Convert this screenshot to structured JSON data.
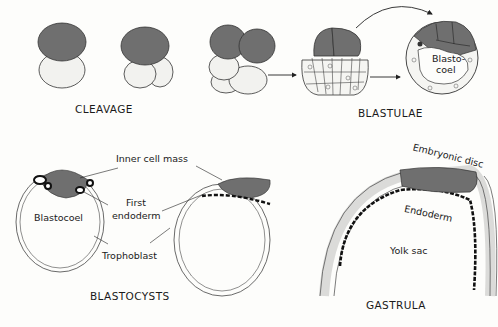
{
  "captions": {
    "cleavage": "CLEAVAGE",
    "blastulae": "BLASTULAE",
    "blastocysts": "BLASTOCYSTS",
    "gastrula": "GASTRULA"
  },
  "labels": {
    "blastocoel_blastula": "Blasto-\ncoel",
    "blastocoel_blastula_l1": "Blasto-",
    "blastocoel_blastula_l2": "coel",
    "inner_cell_mass": "Inner cell mass",
    "blastocoel": "Blastocoel",
    "first_endoderm_l1": "First",
    "first_endoderm_l2": "endoderm",
    "trophoblast": "Trophoblast",
    "embryonic_disc": "Embryonic disc",
    "endoderm": "Endoderm",
    "yolk_sac": "Yolk sac"
  },
  "colors": {
    "dark_cell": "#6f6f6f",
    "light_cell": "#f2f2ef",
    "outline": "#2a2a2a",
    "endoderm": "#111111",
    "background": "#fdfdfb"
  }
}
